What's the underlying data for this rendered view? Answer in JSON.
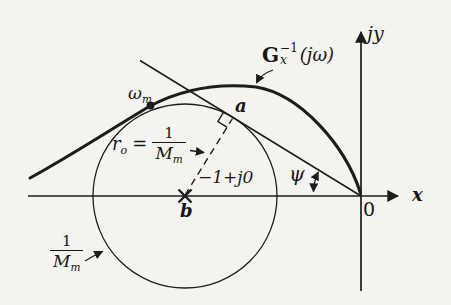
{
  "figure": {
    "background": "#f5f3ef",
    "ink": "#1c1c1c"
  },
  "axes": {
    "x_label": "x",
    "y_label": "jy",
    "origin_label": "0"
  },
  "curve": {
    "label_base": "G",
    "label_sup": "−1",
    "label_sub": "x",
    "label_arg": "(jω)"
  },
  "markers": {
    "omega_base": "ω",
    "omega_sub": "m",
    "tangency_label": "a",
    "center_label": "b",
    "center_value": "−1+j0",
    "angle_label": "ψ"
  },
  "radius_label": {
    "base": "r",
    "sub": "o",
    "eq": "=",
    "num": "1",
    "den_base": "M",
    "den_sub": "m"
  },
  "circle_label": {
    "num": "1",
    "den_base": "M",
    "den_sub": "m"
  }
}
